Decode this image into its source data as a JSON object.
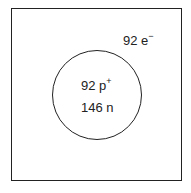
{
  "diagram": {
    "type": "atom-model",
    "electrons": {
      "count": "92 e",
      "charge": "−"
    },
    "nucleus": {
      "protons": {
        "count": "92 p",
        "charge": "+"
      },
      "neutrons": "146 n"
    }
  }
}
